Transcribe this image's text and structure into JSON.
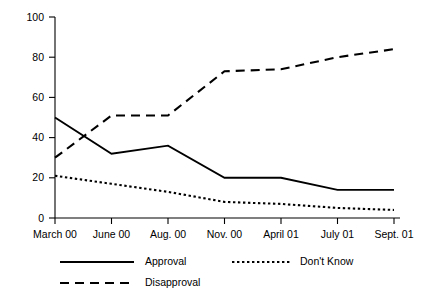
{
  "chart_data": {
    "type": "line",
    "title": "",
    "subtitle": "",
    "xlabel": "",
    "ylabel": "",
    "categories": [
      "March 00",
      "June 00",
      "Aug. 00",
      "Nov. 00",
      "April 01",
      "July 01",
      "Sept. 01"
    ],
    "yticks": [
      0,
      20,
      40,
      60,
      80,
      100
    ],
    "ylim": [
      0,
      100
    ],
    "grid": false,
    "legend_position": "bottom",
    "series": [
      {
        "name": "Approval",
        "style": "solid",
        "color": "#000000",
        "values": [
          50,
          32,
          36,
          20,
          20,
          14,
          14
        ]
      },
      {
        "name": "Disapproval",
        "style": "dashed",
        "color": "#000000",
        "values": [
          30,
          51,
          51,
          73,
          74,
          80,
          84
        ]
      },
      {
        "name": "Don't Know",
        "style": "dotted",
        "color": "#000000",
        "values": [
          21,
          17,
          13,
          8,
          7,
          5,
          4
        ]
      }
    ]
  },
  "axis": {
    "y_tick_labels": [
      "100",
      "80",
      "60",
      "40",
      "20",
      "0"
    ],
    "x_tick_labels": [
      "March 00",
      "June 00",
      "Aug. 00",
      "Nov. 00",
      "April 01",
      "July 01",
      "Sept. 01"
    ]
  },
  "legend": {
    "items": [
      {
        "label": "Approval",
        "style": "solid"
      },
      {
        "label": "Disapproval",
        "style": "dashed"
      },
      {
        "label": "Don't Know",
        "style": "dotted"
      }
    ]
  }
}
